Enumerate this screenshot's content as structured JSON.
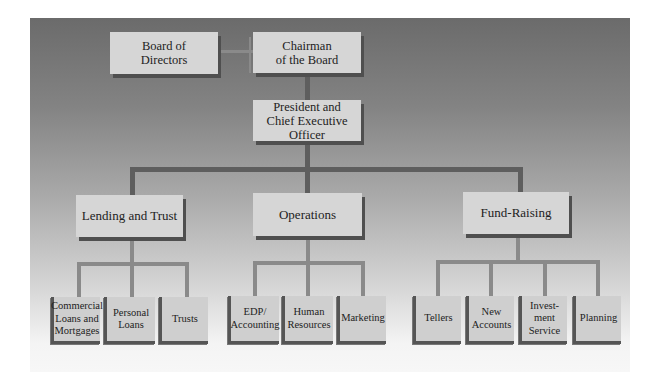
{
  "chart": {
    "type": "organization-chart",
    "top_row": {
      "board": "Board of\nDirectors",
      "chairman": "Chairman\nof the Board"
    },
    "executive": "President and\nChief Executive Officer",
    "divisions": [
      {
        "name": "Lending and Trust",
        "units": [
          "Commercial\nLoans and\nMortgages",
          "Personal\nLoans",
          "Trusts"
        ]
      },
      {
        "name": "Operations",
        "units": [
          "EDP/\nAccounting",
          "Human\nResources",
          "Marketing"
        ]
      },
      {
        "name": "Fund-Raising",
        "units": [
          "Tellers",
          "New\nAccounts",
          "Invest-\nment\nService",
          "Planning"
        ]
      }
    ]
  },
  "colors": {
    "box_fill": "#d6d6d6",
    "connector": "#5e5e5e",
    "panel_top": "#6b6b6b",
    "panel_bottom": "#f7f7f7"
  }
}
